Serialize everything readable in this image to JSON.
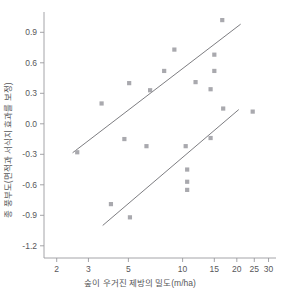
{
  "chart_data": {
    "type": "scatter",
    "title": "",
    "xlabel": "숲이 우거진 제방의 밀도(m/ha)",
    "ylabel": "종 풍부도(면적과 서식지 효과를 보정)",
    "xscale": "log",
    "yscale": "linear",
    "xlim": [
      1.7,
      33
    ],
    "ylim": [
      -1.32,
      1.08
    ],
    "grid": false,
    "legend": "none",
    "xticks": [
      2,
      3,
      5,
      10,
      15,
      20,
      25,
      30
    ],
    "xtick_labels": [
      "2",
      "3",
      "5",
      "10",
      "15",
      "20",
      "25",
      "30"
    ],
    "yticks": [
      0.9,
      0.6,
      0.3,
      0.0,
      -0.3,
      -0.6,
      -0.9,
      -1.2
    ],
    "ytick_labels": [
      "0.9",
      "0.6",
      "0.3",
      "0.0",
      "-0.3",
      "-0.6",
      "-0.9",
      "-1.2"
    ],
    "series": [
      {
        "name": "upper-group",
        "marker": "square",
        "color": "#a9a9ae",
        "points": [
          {
            "x": 2.6,
            "y": -0.28
          },
          {
            "x": 3.55,
            "y": 0.2
          },
          {
            "x": 4.75,
            "y": -0.15
          },
          {
            "x": 5.05,
            "y": 0.4
          },
          {
            "x": 6.3,
            "y": -0.22
          },
          {
            "x": 6.6,
            "y": 0.33
          },
          {
            "x": 7.9,
            "y": 0.52
          },
          {
            "x": 9.0,
            "y": 0.73
          },
          {
            "x": 11.8,
            "y": 0.41
          },
          {
            "x": 14.3,
            "y": 0.34
          },
          {
            "x": 15.0,
            "y": 0.68
          },
          {
            "x": 15.0,
            "y": 0.52
          },
          {
            "x": 16.6,
            "y": 1.02
          }
        ]
      },
      {
        "name": "lower-group",
        "marker": "square",
        "color": "#a9a9ae",
        "points": [
          {
            "x": 4.0,
            "y": -0.79
          },
          {
            "x": 5.1,
            "y": -0.92
          },
          {
            "x": 10.4,
            "y": -0.22
          },
          {
            "x": 10.6,
            "y": -0.45
          },
          {
            "x": 10.6,
            "y": -0.57
          },
          {
            "x": 10.6,
            "y": -0.65
          },
          {
            "x": 14.3,
            "y": -0.14
          },
          {
            "x": 16.8,
            "y": 0.15
          },
          {
            "x": 24.5,
            "y": 0.12
          }
        ]
      }
    ],
    "trend_lines": [
      {
        "name": "upper-trend",
        "x_start": 2.45,
        "y_start": -0.285,
        "x_end": 21.0,
        "y_end": 0.98
      },
      {
        "name": "lower-trend",
        "x_start": 3.6,
        "y_start": -1.0,
        "x_end": 20.5,
        "y_end": 0.14
      }
    ]
  }
}
